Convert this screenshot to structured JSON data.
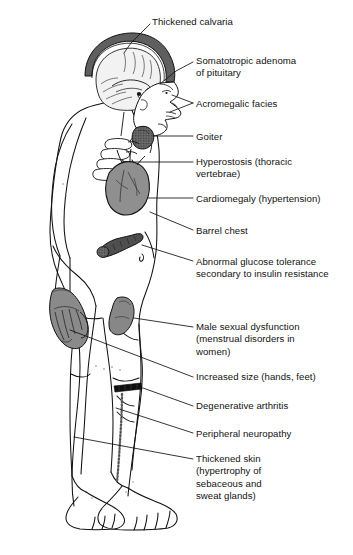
{
  "diagram": {
    "background_color": "#ffffff",
    "ink_color": "#121212",
    "organ_fill_gray": "#8f8f8f",
    "organ_fill_dark": "#4a4a4a",
    "skull_fill": "#6e6e6e",
    "labels": [
      {
        "id": "thickened-calvaria",
        "text": "Thickened calvaria",
        "x": 152,
        "y": 16,
        "lines": 1,
        "target": "skull-vault"
      },
      {
        "id": "somatotropic-adenoma",
        "text": "Somatotropic adenoma\nof pituitary",
        "x": 196,
        "y": 55,
        "lines": 2,
        "target": "pituitary-gland"
      },
      {
        "id": "acromegalic-facies",
        "text": "Acromegalic facies",
        "x": 196,
        "y": 98,
        "lines": 1,
        "target": "face-profile"
      },
      {
        "id": "goiter",
        "text": "Goiter",
        "x": 196,
        "y": 131,
        "lines": 1,
        "target": "thyroid-mass"
      },
      {
        "id": "hyperostosis",
        "text": "Hyperostosis (thoracic\nvertebrae)",
        "x": 196,
        "y": 156,
        "lines": 2,
        "target": "thoracic-vertebrae"
      },
      {
        "id": "cardiomegaly",
        "text": "Cardiomegaly (hypertension)",
        "x": 196,
        "y": 193,
        "lines": 1,
        "target": "heart"
      },
      {
        "id": "barrel-chest",
        "text": "Barrel chest",
        "x": 196,
        "y": 225,
        "lines": 1,
        "target": "chest-wall"
      },
      {
        "id": "abnormal-glucose-tolerance",
        "text": "Abnormal glucose tolerance\nsecondary to insulin resistance",
        "x": 196,
        "y": 256,
        "lines": 2,
        "target": "pancreas"
      },
      {
        "id": "male-sexual-dysfunction",
        "text": "Male sexual dysfunction\n(menstrual disorders in\nwomen)",
        "x": 196,
        "y": 321,
        "lines": 3,
        "target": "genitalia"
      },
      {
        "id": "increased-size-hands-feet",
        "text": "Increased size (hands, feet)",
        "x": 196,
        "y": 371,
        "lines": 1,
        "target": "hand"
      },
      {
        "id": "degenerative-arthritis",
        "text": "Degenerative arthritis",
        "x": 196,
        "y": 400,
        "lines": 1,
        "target": "knee-joint"
      },
      {
        "id": "peripheral-neuropathy",
        "text": "Peripheral neuropathy",
        "x": 196,
        "y": 428,
        "lines": 1,
        "target": "leg-nerve"
      },
      {
        "id": "thickened-skin",
        "text": "Thickened skin\n(hypertrophy of\nsebaceous and\nsweat glands)",
        "x": 196,
        "y": 453,
        "lines": 4,
        "target": "skin-surface"
      }
    ],
    "leaders": [
      {
        "id": "leader-thickened-calvaria",
        "points": "150,24 131,43 124,53"
      },
      {
        "id": "leader-somatotropic-adenoma",
        "points": "193,62 176,71 162,81"
      },
      {
        "id": "leader-acromegalic-facies",
        "points": "193,103 171,96"
      },
      {
        "id": "leader-acromegalic-facies-2",
        "points": "193,103 170,110"
      },
      {
        "id": "leader-goiter",
        "points": "193,136 151,136"
      },
      {
        "id": "leader-hyperostosis",
        "points": "193,162 134,162"
      },
      {
        "id": "leader-cardiomegaly",
        "points": "193,198 141,198"
      },
      {
        "id": "leader-barrel-chest",
        "points": "193,230 152,212"
      },
      {
        "id": "leader-glucose",
        "points": "193,261 146,246"
      },
      {
        "id": "leader-male-dysfunction",
        "points": "193,327 138,327"
      },
      {
        "id": "leader-increased-size",
        "points": "193,377 68,308"
      },
      {
        "id": "leader-degenerative",
        "points": "193,406 143,389"
      },
      {
        "id": "leader-peripheral",
        "points": "193,433 110,406"
      },
      {
        "id": "leader-thickened-skin",
        "points": "193,459 73,437"
      }
    ],
    "organ_parts": [
      {
        "id": "skull-vault",
        "name": "thickened-calvaria-shading"
      },
      {
        "id": "brain",
        "name": "brain-sagittal-section"
      },
      {
        "id": "pituitary-gland",
        "name": "pituitary-adenoma-mass"
      },
      {
        "id": "thyroid-mass",
        "name": "goiter-mass"
      },
      {
        "id": "thoracic-vertebrae",
        "name": "vertebral-bodies"
      },
      {
        "id": "heart",
        "name": "enlarged-heart"
      },
      {
        "id": "pancreas",
        "name": "pancreas"
      },
      {
        "id": "hand",
        "name": "enlarged-hand"
      },
      {
        "id": "genitalia",
        "name": "genital-region"
      },
      {
        "id": "knee-joint",
        "name": "knee-arthritis-marking"
      },
      {
        "id": "leg-nerve",
        "name": "peripheral-nerve-stipple"
      },
      {
        "id": "feet",
        "name": "enlarged-feet"
      }
    ]
  }
}
